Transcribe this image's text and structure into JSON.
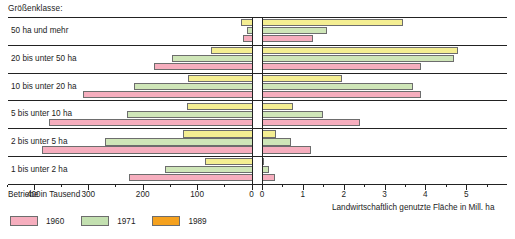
{
  "header": {
    "size_class_label": "Größenklasse:"
  },
  "axes": {
    "left": {
      "title": "Betriebe in Tausend",
      "ticks": [
        400,
        300,
        200,
        100,
        0
      ],
      "max": 450,
      "unit": "Tausend"
    },
    "right": {
      "title": "Landwirtschaftlich genutzte Fläche in Mill. ha",
      "ticks": [
        0,
        1,
        2,
        3,
        4,
        5
      ],
      "max": 6,
      "unit": "Mill. ha"
    }
  },
  "legend": {
    "items": [
      {
        "label": "1960",
        "color": "#f6aebe"
      },
      {
        "label": "1971",
        "color": "#c3e0b0"
      },
      {
        "label": "1989",
        "color": "#f5a11e"
      }
    ]
  },
  "bar_colors": {
    "1960": "#f6aebe",
    "1971": "#cfe6b8",
    "1989": "#f4ee92"
  },
  "chart_data": {
    "type": "bar",
    "orientation": "horizontal",
    "layout": "butterfly",
    "title": "Größenklasse:",
    "categories": [
      "50 ha und mehr",
      "20 bis unter 50 ha",
      "10 bis unter 20 ha",
      "5 bis unter 10 ha",
      "2 bis unter 5 ha",
      "1 bis unter 2 ha"
    ],
    "panels": [
      {
        "side": "left",
        "xlabel": "Betriebe in Tausend",
        "xlim": [
          450,
          0
        ],
        "ticks": [
          400,
          300,
          200,
          100,
          0
        ],
        "series": [
          {
            "name": "1989",
            "values": [
              22,
              78,
              120,
              122,
              128,
              88
            ]
          },
          {
            "name": "1971",
            "values": [
              11,
              148,
              218,
              232,
              272,
              162
            ]
          },
          {
            "name": "1960",
            "values": [
              18,
              182,
              312,
              375,
              388,
              228
            ]
          }
        ]
      },
      {
        "side": "right",
        "xlabel": "Landwirtschaftlich genutzte Fläche in Mill. ha",
        "xlim": [
          0,
          6
        ],
        "ticks": [
          0,
          1,
          2,
          3,
          4,
          5
        ],
        "series": [
          {
            "name": "1989",
            "values": [
              3.45,
              4.8,
              1.95,
              0.75,
              0.35,
              0.05
            ]
          },
          {
            "name": "1971",
            "values": [
              1.6,
              4.7,
              3.7,
              1.5,
              0.7,
              0.17
            ]
          },
          {
            "name": "1960",
            "values": [
              1.25,
              3.9,
              3.9,
              2.4,
              1.2,
              0.33
            ]
          }
        ]
      }
    ],
    "grid": false,
    "legend_position": "bottom-left"
  }
}
